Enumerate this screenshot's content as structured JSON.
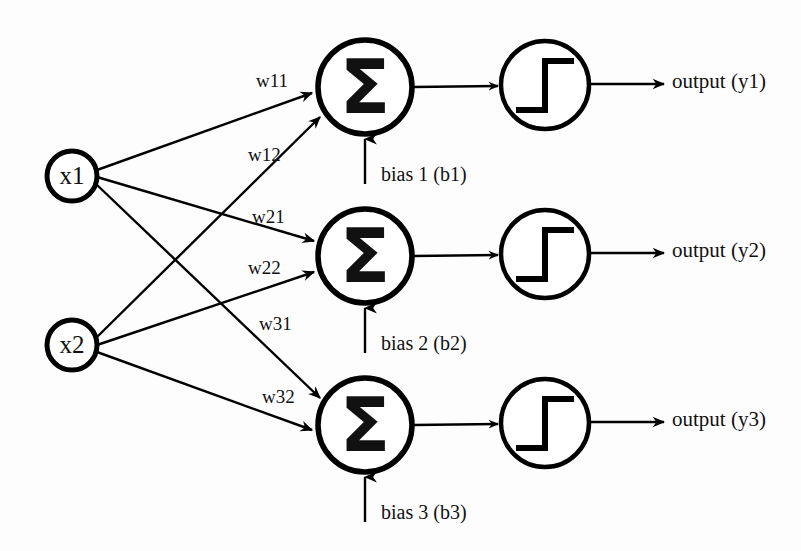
{
  "diagram": {
    "background_color": "#fdfdfd",
    "stroke_color": "#000000",
    "inputs": [
      {
        "id": "x1",
        "label": "x1",
        "cx": 72,
        "cy": 176,
        "r": 25
      },
      {
        "id": "x2",
        "label": "x2",
        "cx": 72,
        "cy": 345,
        "r": 25
      }
    ],
    "neurons": [
      {
        "id": "n1",
        "symbol": "Σ",
        "cx": 365,
        "cy": 87,
        "r": 47
      },
      {
        "id": "n2",
        "symbol": "Σ",
        "cx": 365,
        "cy": 256,
        "r": 47
      },
      {
        "id": "n3",
        "symbol": "Σ",
        "cx": 365,
        "cy": 425,
        "r": 47
      }
    ],
    "activations": [
      {
        "id": "a1",
        "glyph": "step-function",
        "cx": 545,
        "cy": 85,
        "r": 44
      },
      {
        "id": "a2",
        "glyph": "step-function",
        "cx": 545,
        "cy": 254,
        "r": 44
      },
      {
        "id": "a3",
        "glyph": "step-function",
        "cx": 545,
        "cy": 423,
        "r": 44
      }
    ],
    "weights": [
      {
        "id": "w11",
        "label": "w11",
        "from": "x1",
        "to": "n1",
        "x": 256,
        "y": 83
      },
      {
        "id": "w12",
        "label": "w12",
        "from": "x1",
        "to": "n2",
        "x": 248,
        "y": 157
      },
      {
        "id": "w21",
        "label": "w21",
        "from": "x1",
        "to": "n3",
        "x": 252,
        "y": 219
      },
      {
        "id": "w22",
        "label": "w22",
        "from": "x2",
        "to": "n1",
        "x": 248,
        "y": 270
      },
      {
        "id": "w31",
        "label": "w31",
        "from": "x2",
        "to": "n2",
        "x": 259,
        "y": 326
      },
      {
        "id": "w32",
        "label": "w32",
        "from": "x2",
        "to": "n3",
        "x": 262,
        "y": 399
      }
    ],
    "biases": [
      {
        "id": "b1",
        "label": "bias 1 (b1)",
        "x": 381,
        "y": 176,
        "arrow_x": 365
      },
      {
        "id": "b2",
        "label": "bias 2 (b2)",
        "x": 381,
        "y": 345,
        "arrow_x": 365
      },
      {
        "id": "b3",
        "label": "bias 3 (b3)",
        "x": 381,
        "y": 514,
        "arrow_x": 365
      }
    ],
    "outputs": [
      {
        "id": "y1",
        "label": "output (y1)",
        "x": 672,
        "y": 83
      },
      {
        "id": "y2",
        "label": "output (y2)",
        "x": 672,
        "y": 252
      },
      {
        "id": "y3",
        "label": "output (y3)",
        "x": 672,
        "y": 421
      }
    ]
  }
}
